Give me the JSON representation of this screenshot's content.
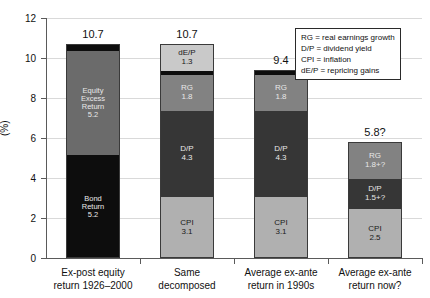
{
  "chart_data": {
    "type": "bar",
    "title": "",
    "subtitle": "",
    "xlabel": "",
    "ylabel": "(%)",
    "ylim": [
      0,
      12
    ],
    "yticks": [
      0,
      2,
      4,
      6,
      8,
      10,
      12
    ],
    "ytick_labels": [
      "0",
      "2",
      "4",
      "6",
      "8",
      "10",
      "12"
    ],
    "grid": true,
    "grid_axis": "y",
    "legend_position": "top-right",
    "stacked": true,
    "categories": [
      "Ex-post equity return 1926–2000",
      "Same decomposed",
      "Average ex-ante return in 1990s",
      "Average ex-ante return now?"
    ],
    "category_lines": [
      [
        "Ex-post equity",
        "return 1926–2000"
      ],
      [
        "Same",
        "decomposed"
      ],
      [
        "Average ex-ante",
        "return in 1990s"
      ],
      [
        "Average ex-ante",
        "return now?"
      ]
    ],
    "totals": [
      "10.7",
      "10.7",
      "9.4",
      "5.8?"
    ],
    "total_values": [
      10.7,
      10.7,
      9.4,
      5.8
    ],
    "bars": [
      {
        "name": "Ex-post equity return 1926-2000",
        "total_label": "10.7",
        "segments": [
          {
            "label": "Bond Return",
            "label_lines": [
              "Bond",
              "Return"
            ],
            "value_label": "5.2",
            "value": 5.2,
            "color": "#0d0d0d",
            "text_color": "#e8e8e8"
          },
          {
            "label": "Equity Excess Return",
            "label_lines": [
              "Equity",
              "Excess",
              "Return"
            ],
            "value_label": "5.2",
            "value": 5.2,
            "color": "#6b6b6b",
            "text_color": "#e8e8e8"
          },
          {
            "label": "cap",
            "label_lines": [],
            "value_label": "",
            "value": 0.3,
            "color": "#0d0d0d",
            "text_color": "#e8e8e8"
          }
        ]
      },
      {
        "name": "Same decomposed",
        "total_label": "10.7",
        "segments": [
          {
            "label": "CPI",
            "label_lines": [
              "CPI"
            ],
            "value_label": "3.1",
            "value": 3.1,
            "color": "#b0b0b0",
            "text_color": "#1a1a1a"
          },
          {
            "label": "D/P",
            "label_lines": [
              "D/P"
            ],
            "value_label": "4.3",
            "value": 4.3,
            "color": "#363636",
            "text_color": "#e8e8e8"
          },
          {
            "label": "RG",
            "label_lines": [
              "RG"
            ],
            "value_label": "1.8",
            "value": 1.8,
            "color": "#828282",
            "text_color": "#e8e8e8"
          },
          {
            "label": "divider",
            "label_lines": [],
            "value_label": "",
            "value": 0.2,
            "color": "#0d0d0d",
            "text_color": "#e8e8e8"
          },
          {
            "label": "dE/P",
            "label_lines": [
              "dE/P"
            ],
            "value_label": "1.3",
            "value": 1.3,
            "color": "#c9c9c9",
            "text_color": "#1a1a1a"
          }
        ]
      },
      {
        "name": "Average ex-ante return in 1990s",
        "total_label": "9.4",
        "segments": [
          {
            "label": "CPI",
            "label_lines": [
              "CPI"
            ],
            "value_label": "3.1",
            "value": 3.1,
            "color": "#b0b0b0",
            "text_color": "#1a1a1a"
          },
          {
            "label": "D/P",
            "label_lines": [
              "D/P"
            ],
            "value_label": "4.3",
            "value": 4.3,
            "color": "#363636",
            "text_color": "#e8e8e8"
          },
          {
            "label": "RG",
            "label_lines": [
              "RG"
            ],
            "value_label": "1.8",
            "value": 1.8,
            "color": "#828282",
            "text_color": "#e8e8e8"
          },
          {
            "label": "cap",
            "label_lines": [],
            "value_label": "",
            "value": 0.2,
            "color": "#0d0d0d",
            "text_color": "#e8e8e8"
          }
        ]
      },
      {
        "name": "Average ex-ante return now?",
        "total_label": "5.8?",
        "segments": [
          {
            "label": "CPI",
            "label_lines": [
              "CPI"
            ],
            "value_label": "2.5",
            "value": 2.5,
            "color": "#b0b0b0",
            "text_color": "#1a1a1a"
          },
          {
            "label": "D/P",
            "label_lines": [
              "D/P"
            ],
            "value_label": "1.5+?",
            "value": 1.5,
            "color": "#363636",
            "text_color": "#e8e8e8"
          },
          {
            "label": "RG",
            "label_lines": [
              "RG"
            ],
            "value_label": "1.8+?",
            "value": 1.8,
            "color": "#828282",
            "text_color": "#e8e8e8"
          }
        ]
      }
    ],
    "legend_entries": [
      "RG = real earnings growth",
      "D/P = dividend yield",
      "CPI = inflation",
      "dE/P = repricing gains"
    ],
    "colors": {
      "cpi": "#b0b0b0",
      "dp": "#363636",
      "rg": "#828282",
      "dep": "#c9c9c9",
      "bond_return": "#0d0d0d",
      "equity_excess_return": "#6b6b6b",
      "grid": "#d9d9d9",
      "axis": "#5a5a5a",
      "background": "#ffffff"
    }
  }
}
